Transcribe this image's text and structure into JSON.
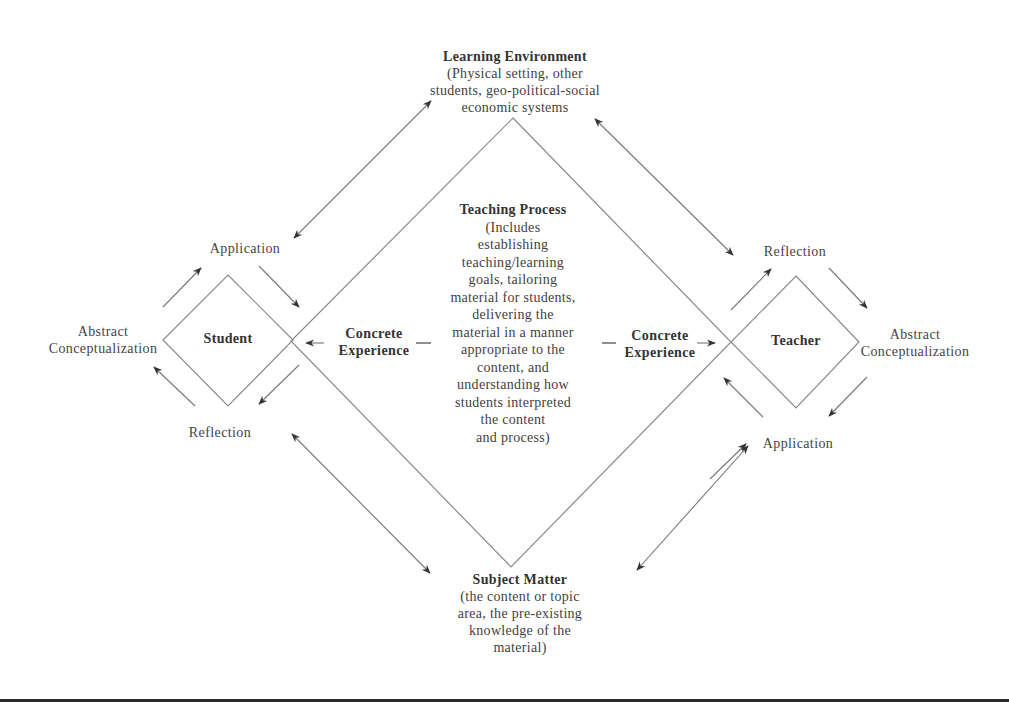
{
  "colors": {
    "line": "#8a8a8a",
    "arrow": "#333333",
    "text": "#3f3f3f",
    "rule": "#2b2b2b"
  },
  "learning_environment": {
    "title": "Learning Environment",
    "lines": [
      "(Physical setting, other",
      "students, geo-political-social",
      "economic systems"
    ]
  },
  "teaching_process": {
    "title": "Teaching Process",
    "lines": [
      "(Includes",
      "establishing",
      "teaching/learning",
      "goals, tailoring",
      "material for students,",
      "delivering the",
      "material in a manner",
      "appropriate to the",
      "content, and",
      "understanding how",
      "students interpreted",
      "the content",
      "and process)"
    ]
  },
  "subject_matter": {
    "title": "Subject Matter",
    "lines": [
      "(the content or topic",
      "area, the pre-existing",
      "knowledge of the",
      "material)"
    ]
  },
  "student": {
    "label": "Student",
    "application": "Application",
    "reflection": "Reflection",
    "abstract_line1": "Abstract",
    "abstract_line2": "Conceptualization"
  },
  "teacher": {
    "label": "Teacher",
    "application": "Application",
    "reflection": "Reflection",
    "abstract_line1": "Abstract",
    "abstract_line2": "Conceptualization"
  },
  "concrete_left": {
    "line1": "Concrete",
    "line2": "Experience"
  },
  "concrete_right": {
    "line1": "Concrete",
    "line2": "Experience"
  },
  "geometry": {
    "big_diamond": [
      [
        513,
        118
      ],
      [
        731,
        342
      ],
      [
        511,
        567
      ],
      [
        291,
        341
      ]
    ],
    "student_diamond": [
      [
        228,
        275
      ],
      [
        293,
        340
      ],
      [
        228,
        406
      ],
      [
        163,
        340
      ]
    ],
    "teacher_diamond": [
      [
        796,
        276
      ],
      [
        859,
        342
      ],
      [
        796,
        408
      ],
      [
        731,
        342
      ]
    ],
    "double_arrows": [
      {
        "name": "env-student",
        "from": [
          294,
          238
        ],
        "to": [
          431,
          101
        ]
      },
      {
        "name": "env-teacher",
        "from": [
          595,
          119
        ],
        "to": [
          733,
          255
        ]
      },
      {
        "name": "subject-student",
        "from": [
          292,
          434
        ],
        "to": [
          430,
          573
        ]
      },
      {
        "name": "subject-teacher",
        "from": [
          637,
          570
        ],
        "to": [
          748,
          446
        ]
      }
    ],
    "single_arrows": [
      {
        "name": "student-abstract-to-application",
        "from": [
          163,
          307
        ],
        "to": [
          201,
          268
        ]
      },
      {
        "name": "student-application-to-concrete",
        "from": [
          259,
          266
        ],
        "to": [
          299,
          307
        ]
      },
      {
        "name": "student-concrete-to-reflection",
        "from": [
          299,
          365
        ],
        "to": [
          259,
          404
        ]
      },
      {
        "name": "student-reflection-to-abstract",
        "from": [
          195,
          406
        ],
        "to": [
          154,
          367
        ]
      },
      {
        "name": "concrete-left-arrow",
        "from": [
          324,
          343
        ],
        "to": [
          306,
          343
        ]
      },
      {
        "name": "concrete-right-arrow",
        "from": [
          697,
          343
        ],
        "to": [
          715,
          343
        ]
      },
      {
        "name": "teacher-concrete-to-reflection",
        "from": [
          731,
          310
        ],
        "to": [
          771,
          269
        ]
      },
      {
        "name": "teacher-reflection-to-abstract",
        "from": [
          829,
          268
        ],
        "to": [
          867,
          308
        ]
      },
      {
        "name": "teacher-abstract-to-application",
        "from": [
          867,
          377
        ],
        "to": [
          829,
          416
        ]
      },
      {
        "name": "teacher-application-to-concrete",
        "from": [
          763,
          417
        ],
        "to": [
          724,
          378
        ]
      },
      {
        "name": "teacher-application-from-subject",
        "from": [
          710,
          479
        ],
        "to": [
          746,
          444
        ]
      }
    ],
    "dashes": [
      {
        "name": "concrete-left-dash",
        "from": [
          416,
          343
        ],
        "to": [
          431,
          343
        ]
      },
      {
        "name": "concrete-right-dash",
        "from": [
          602,
          343
        ],
        "to": [
          616,
          343
        ]
      }
    ]
  }
}
